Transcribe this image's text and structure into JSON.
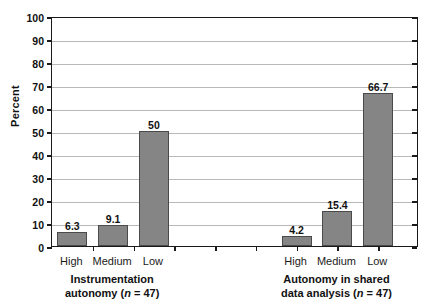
{
  "chart_data": {
    "type": "bar",
    "title": "",
    "xlabel": "",
    "ylabel": "Percent",
    "ylim": [
      0,
      100
    ],
    "ytick_step": 10,
    "yticks": [
      "100",
      "90",
      "80",
      "70",
      "60",
      "50",
      "40",
      "30",
      "20",
      "10",
      "0"
    ],
    "grid": true,
    "legend": "none",
    "bar_color": "#858585",
    "bar_edge_color": "#4a4a4a",
    "grid_color": "#b9b9b9",
    "axis_color": "#1a1a1a",
    "groups": [
      {
        "caption_line1": "Instrumentation",
        "caption_line2_pre": "autonomy (",
        "caption_line2_italic": "n",
        "caption_line2_post": " = 47)",
        "categories": [
          "High",
          "Medium",
          "Low"
        ],
        "values": [
          6.3,
          9.1,
          50
        ],
        "value_labels": [
          "6.3",
          "9.1",
          "50"
        ]
      },
      {
        "caption_line1": "Autonomy in shared",
        "caption_line2_pre": "data analysis (",
        "caption_line2_italic": "n",
        "caption_line2_post": " = 47)",
        "categories": [
          "High",
          "Medium",
          "Low"
        ],
        "values": [
          4.2,
          15.4,
          66.7
        ],
        "value_labels": [
          "4.2",
          "15.4",
          "66.7"
        ]
      }
    ]
  }
}
